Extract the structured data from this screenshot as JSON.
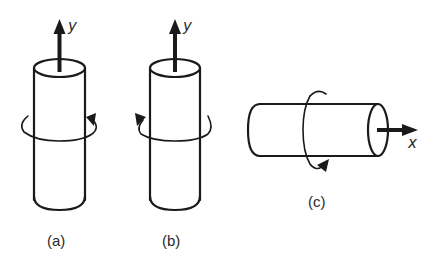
{
  "figure": {
    "panels": [
      {
        "id": "a",
        "label": "(a)",
        "axis_label": "y",
        "orientation": "vertical",
        "rotation_direction": "counterclockwise-viewed-from-top"
      },
      {
        "id": "b",
        "label": "(b)",
        "axis_label": "y",
        "orientation": "vertical",
        "rotation_direction": "clockwise-viewed-from-top"
      },
      {
        "id": "c",
        "label": "(c)",
        "axis_label": "x",
        "orientation": "horizontal",
        "rotation_direction": "about-x-axis"
      }
    ],
    "colors": {
      "line": "#1a1a1a",
      "background": "#ffffff"
    }
  }
}
